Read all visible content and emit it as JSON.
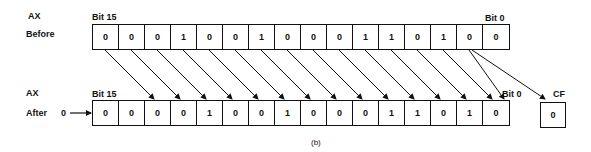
{
  "figure": {
    "caption": "(b)",
    "before": {
      "register_label": "AX",
      "row_label": "Before",
      "msb_label": "Bit 15",
      "lsb_label": "Bit 0",
      "bits": [
        "0",
        "0",
        "0",
        "1",
        "0",
        "0",
        "1",
        "0",
        "0",
        "0",
        "1",
        "1",
        "0",
        "1",
        "0",
        "0"
      ]
    },
    "after": {
      "register_label": "AX",
      "row_label": "After",
      "msb_label": "Bit 15",
      "lsb_label": "Bit 0",
      "shift_in_value": "0",
      "bits": [
        "0",
        "0",
        "0",
        "0",
        "1",
        "0",
        "0",
        "1",
        "0",
        "0",
        "0",
        "1",
        "1",
        "0",
        "1",
        "0"
      ]
    },
    "carry_flag": {
      "label": "CF",
      "value": "0"
    }
  }
}
